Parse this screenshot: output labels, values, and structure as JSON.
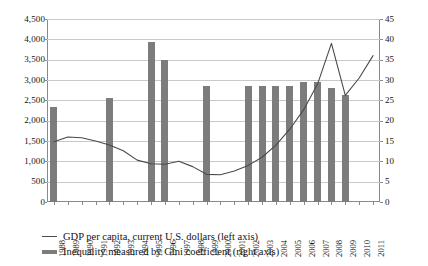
{
  "chart_data": {
    "type": "bar",
    "title": "",
    "subtitle": "",
    "xlabel": "",
    "ylabel": "",
    "categories": [
      "1988",
      "1989",
      "1990",
      "1991",
      "1992",
      "1993",
      "1994",
      "1995",
      "1996",
      "1997",
      "1998",
      "1999",
      "2000",
      "2001",
      "2002",
      "2003",
      "2004",
      "2005",
      "2006",
      "2007",
      "2008",
      "2009",
      "2010",
      "2011"
    ],
    "grid": true,
    "legend_position": "bottom-left",
    "axes": {
      "left": {
        "label": "GDP per capita, current U.S. dollars",
        "ticks": [
          "0",
          "500",
          "1,000",
          "1,500",
          "2,000",
          "2,500",
          "3,000",
          "3,500",
          "4,000",
          "4,500"
        ],
        "tick_values": [
          0,
          500,
          1000,
          1500,
          2000,
          2500,
          3000,
          3500,
          4000,
          4500
        ],
        "ylim": [
          0,
          4500
        ]
      },
      "right": {
        "label": "Inequality measured by Gini coefficient",
        "ticks": [
          "0",
          "5",
          "10",
          "15",
          "20",
          "25",
          "30",
          "35",
          "40",
          "45"
        ],
        "tick_values": [
          0,
          5,
          10,
          15,
          20,
          25,
          30,
          35,
          40,
          45
        ],
        "ylim": [
          0,
          45
        ]
      }
    },
    "series": [
      {
        "name": "GDP per capita, current U.S. dollars (left axis)",
        "type": "line",
        "axis": "left",
        "color": "#4a4a4a",
        "values": [
          1480,
          1600,
          1580,
          1500,
          1400,
          1260,
          1030,
          940,
          930,
          1000,
          870,
          680,
          670,
          760,
          900,
          1100,
          1400,
          1790,
          2270,
          2900,
          3900,
          2620,
          3050,
          3600
        ]
      },
      {
        "name": "Inequality measured by Gini coefficient (right axis)",
        "type": "bar",
        "axis": "right",
        "color": "#7c7c7c",
        "values": [
          23.3,
          null,
          null,
          null,
          25.6,
          null,
          null,
          39.3,
          35.0,
          null,
          null,
          28.5,
          null,
          null,
          28.5,
          28.5,
          28.5,
          28.5,
          29.5,
          29.5,
          28.0,
          26.3,
          null,
          null
        ]
      }
    ]
  }
}
